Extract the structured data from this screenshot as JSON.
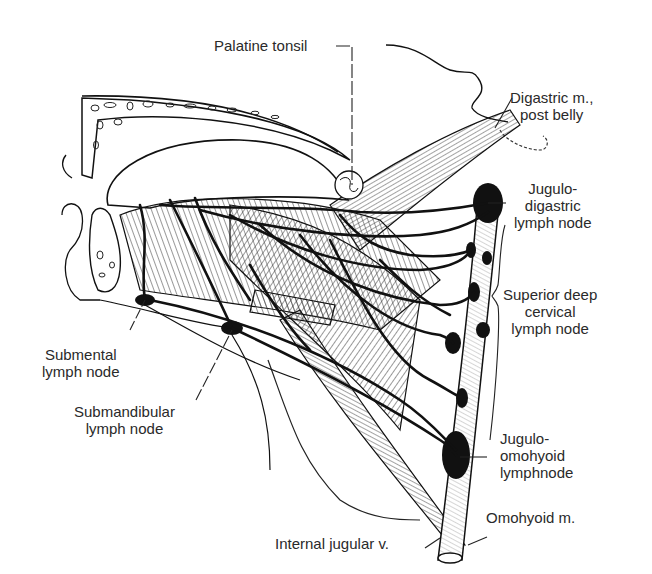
{
  "figure": {
    "colors": {
      "ink": "#111111",
      "label_text": "#2a2a2a",
      "background": "#ffffff",
      "hatch": "#444444"
    }
  },
  "labels": {
    "palatine_tonsil": {
      "lines": [
        "Palatine tonsil"
      ]
    },
    "digastric": {
      "lines": [
        "Digastric m.,",
        "post belly"
      ]
    },
    "jugulodigastric": {
      "lines": [
        "Jugulo-",
        "digastric",
        "lymph node"
      ]
    },
    "superior_deep_cervical": {
      "lines": [
        "Superior deep",
        "cervical",
        "lymph node"
      ]
    },
    "jugulo_omohyoid": {
      "lines": [
        "Jugulo-",
        "omohyoid",
        "lymphnode"
      ]
    },
    "omohyoid": {
      "lines": [
        "Omohyoid m."
      ]
    },
    "internal_jugular": {
      "lines": [
        "Internal jugular v."
      ]
    },
    "submental": {
      "lines": [
        "Submental",
        "lymph node"
      ]
    },
    "submandibular": {
      "lines": [
        "Submandibular",
        "lymph node"
      ]
    }
  }
}
